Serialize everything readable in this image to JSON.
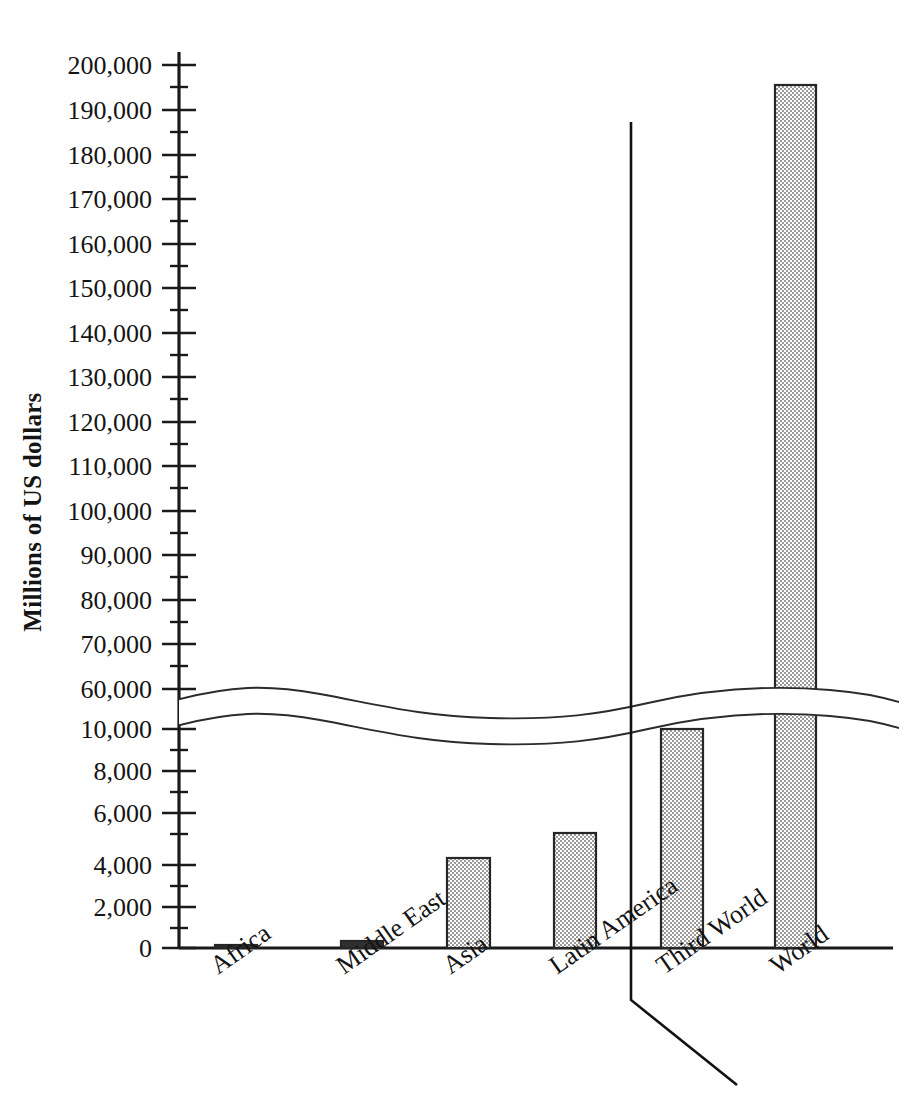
{
  "chart_data": {
    "type": "bar",
    "title": "",
    "subtitle": "",
    "xlabel": "",
    "ylabel": "Millions of US dollars",
    "categories": [
      "Africa",
      "Middle East",
      "Asia",
      "Latin America",
      "Third World",
      "World"
    ],
    "values": [
      100,
      350,
      4300,
      5400,
      10000,
      195000
    ],
    "value_labels": [
      "",
      "",
      "",
      "",
      "",
      ""
    ],
    "ylim": [
      0,
      200000
    ],
    "y_axis_broken": true,
    "y_break_lower_max": 10000,
    "y_break_upper_min": 60000,
    "y_ticks_lower": [
      0,
      2000,
      4000,
      6000,
      8000,
      10000
    ],
    "y_ticks_upper": [
      60000,
      70000,
      80000,
      90000,
      100000,
      110000,
      120000,
      130000,
      140000,
      150000,
      160000,
      170000,
      180000,
      190000,
      200000
    ],
    "y_tick_labels": [
      "200,000",
      "190,000",
      "180,000",
      "170,000",
      "160,000",
      "150,000",
      "140,000",
      "130,000",
      "120,000",
      "110,000",
      "100,000",
      "90,000",
      "80,000",
      "70,000",
      "60,000",
      "10,000",
      "8,000",
      "6,000",
      "4,000",
      "2,000",
      "0"
    ],
    "minor_ticks": true,
    "grid": false,
    "legend": null,
    "legend_position": "none",
    "bar_fill_pattern": "checkerboard-dither",
    "bar_fill_color": "#b9b9b9",
    "bar_border_color": "#262626",
    "axis_color": "#1a1a1a",
    "background_color": "#ffffff",
    "group_divider": {
      "present": true,
      "description": "vertical rule separating regional aggregates (Africa, Middle East, Asia, Latin America) from totals (Third World, World), bending diagonally below the axis",
      "separates_left": [
        "Africa",
        "Middle East",
        "Asia",
        "Latin America"
      ],
      "separates_right": [
        "Third World",
        "World"
      ]
    },
    "annotations": [
      {
        "name": "axis-break",
        "text": "",
        "description": "wavy double-line break across the plot between 10,000 and 60,000"
      }
    ]
  },
  "axis": {
    "title": "Millions of US dollars",
    "ticks": [
      {
        "label": "200,000",
        "y": 65,
        "major": true
      },
      {
        "label": "",
        "y": 87,
        "major": false
      },
      {
        "label": "190,000",
        "y": 110,
        "major": true
      },
      {
        "label": "",
        "y": 132,
        "major": false
      },
      {
        "label": "180,000",
        "y": 155,
        "major": true
      },
      {
        "label": "",
        "y": 177,
        "major": false
      },
      {
        "label": "170,000",
        "y": 199,
        "major": true
      },
      {
        "label": "",
        "y": 221,
        "major": false
      },
      {
        "label": "160,000",
        "y": 244,
        "major": true
      },
      {
        "label": "",
        "y": 266,
        "major": false
      },
      {
        "label": "150,000",
        "y": 288,
        "major": true
      },
      {
        "label": "",
        "y": 310,
        "major": false
      },
      {
        "label": "140,000",
        "y": 333,
        "major": true
      },
      {
        "label": "",
        "y": 355,
        "major": false
      },
      {
        "label": "130,000",
        "y": 377,
        "major": true
      },
      {
        "label": "",
        "y": 399,
        "major": false
      },
      {
        "label": "120,000",
        "y": 422,
        "major": true
      },
      {
        "label": "",
        "y": 444,
        "major": false
      },
      {
        "label": "110,000",
        "y": 466,
        "major": true
      },
      {
        "label": "",
        "y": 488,
        "major": false
      },
      {
        "label": "100,000",
        "y": 511,
        "major": true
      },
      {
        "label": "",
        "y": 533,
        "major": false
      },
      {
        "label": "90,000",
        "y": 555,
        "major": true
      },
      {
        "label": "",
        "y": 577,
        "major": false
      },
      {
        "label": "80,000",
        "y": 600,
        "major": true
      },
      {
        "label": "",
        "y": 622,
        "major": false
      },
      {
        "label": "70,000",
        "y": 644,
        "major": true
      },
      {
        "label": "",
        "y": 666,
        "major": false
      },
      {
        "label": "60,000",
        "y": 689,
        "major": true
      },
      {
        "label": "10,000",
        "y": 729,
        "major": true
      },
      {
        "label": "",
        "y": 750,
        "major": false
      },
      {
        "label": "8,000",
        "y": 771,
        "major": true
      },
      {
        "label": "",
        "y": 792,
        "major": false
      },
      {
        "label": "6,000",
        "y": 813,
        "major": true
      },
      {
        "label": "",
        "y": 834,
        "major": false
      },
      {
        "label": "4,000",
        "y": 865,
        "major": true
      },
      {
        "label": "",
        "y": 886,
        "major": false
      },
      {
        "label": "2,000",
        "y": 907,
        "major": true
      },
      {
        "label": "",
        "y": 928,
        "major": false
      },
      {
        "label": "0",
        "y": 948,
        "major": true
      }
    ]
  },
  "bars": [
    {
      "name": "Africa",
      "label": "Africa",
      "x": 215,
      "w": 42,
      "top": 945,
      "value": 100
    },
    {
      "name": "Middle East",
      "label": "Middle East",
      "x": 341,
      "w": 42,
      "top": 941,
      "value": 350
    },
    {
      "name": "Asia",
      "label": "Asia",
      "x": 447,
      "w": 43,
      "top": 858,
      "value": 4300
    },
    {
      "name": "Latin America",
      "label": "Latin America",
      "x": 554,
      "w": 42,
      "top": 833,
      "value": 5400
    },
    {
      "name": "Third World",
      "label": "Third World",
      "x": 661,
      "w": 42,
      "top": 729,
      "value": 10000
    },
    {
      "name": "World",
      "label": "World",
      "x": 775,
      "w": 41,
      "top": 85,
      "value": 195000
    }
  ]
}
